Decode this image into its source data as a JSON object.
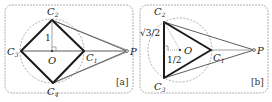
{
  "figure": {
    "panels": [
      {
        "id": "a",
        "tag": "[a]",
        "shape": "square inscribed in unit circle",
        "points": {
          "C1": {
            "label": "C",
            "sub": "1"
          },
          "C2": {
            "label": "C",
            "sub": "2"
          },
          "C3": {
            "label": "C",
            "sub": "3"
          },
          "C4": {
            "label": "C",
            "sub": "4"
          },
          "O": {
            "label": "O"
          },
          "P": {
            "label": "P"
          }
        },
        "measure_labels": {
          "radius": "1"
        }
      },
      {
        "id": "b",
        "tag": "[b]",
        "shape": "equilateral triangle inscribed in unit circle",
        "points": {
          "C1": {
            "label": "C",
            "sub": "1"
          },
          "C2": {
            "label": "C",
            "sub": "2"
          },
          "C3": {
            "label": "C",
            "sub": "3"
          },
          "O": {
            "label": "O"
          },
          "P": {
            "label": "P"
          }
        },
        "measure_labels": {
          "half_side": "√3/2",
          "apothem": "1/2"
        }
      }
    ]
  },
  "colors": {
    "thick_edge": "#1a1a1a",
    "thin_line": "#333333",
    "frame": "#9a9a9a",
    "circle": "#8a8a8a"
  }
}
